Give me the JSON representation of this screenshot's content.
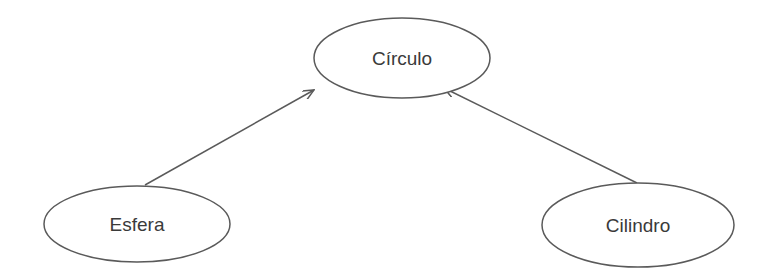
{
  "diagram": {
    "type": "hierarchy",
    "colors": {
      "stroke": "#5a5a5a",
      "text": "#3a3a3a",
      "background": "#ffffff"
    },
    "nodes": [
      {
        "id": "circulo",
        "label": "Círculo",
        "cx": 402,
        "cy": 58,
        "rx": 88,
        "ry": 40
      },
      {
        "id": "esfera",
        "label": "Esfera",
        "cx": 137,
        "cy": 224,
        "rx": 93,
        "ry": 38
      },
      {
        "id": "cilindro",
        "label": "Cilindro",
        "cx": 638,
        "cy": 225,
        "rx": 96,
        "ry": 42
      }
    ],
    "edges": [
      {
        "from": "esfera",
        "to": "circulo",
        "arrow": "to"
      },
      {
        "from": "cilindro",
        "to": "circulo",
        "arrow": "to"
      }
    ]
  }
}
